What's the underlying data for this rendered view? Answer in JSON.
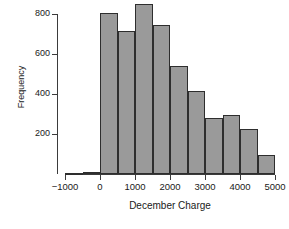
{
  "chart_data": {
    "type": "bar",
    "title": "",
    "xlabel": "December Charge",
    "ylabel": "Frequency",
    "xlim": [
      -1000,
      5000
    ],
    "ylim": [
      0,
      870
    ],
    "grid": false,
    "legend": null,
    "xticks": [
      -1000,
      0,
      1000,
      2000,
      3000,
      4000,
      5000
    ],
    "xtick_labels": [
      "−1000",
      "0",
      "1000",
      "2000",
      "3000",
      "4000",
      "5000"
    ],
    "yticks": [
      200,
      400,
      600,
      800
    ],
    "ytick_labels": [
      "200",
      "400",
      "600",
      "800"
    ],
    "bin_width": 500,
    "bins": [
      {
        "left": -1000,
        "right": -500,
        "value": 4
      },
      {
        "left": -500,
        "right": 0,
        "value": 8
      },
      {
        "left": 0,
        "right": 500,
        "value": 805
      },
      {
        "left": 500,
        "right": 1000,
        "value": 715
      },
      {
        "left": 1000,
        "right": 1500,
        "value": 850
      },
      {
        "left": 1500,
        "right": 2000,
        "value": 745
      },
      {
        "left": 2000,
        "right": 2500,
        "value": 540
      },
      {
        "left": 2500,
        "right": 3000,
        "value": 415
      },
      {
        "left": 3000,
        "right": 3500,
        "value": 280
      },
      {
        "left": 3500,
        "right": 4000,
        "value": 295
      },
      {
        "left": 4000,
        "right": 4500,
        "value": 225
      },
      {
        "left": 4500,
        "right": 5000,
        "value": 95
      }
    ],
    "categories": [
      "-1000 to -500",
      "-500 to 0",
      "0 to 500",
      "500 to 1000",
      "1000 to 1500",
      "1500 to 2000",
      "2000 to 2500",
      "2500 to 3000",
      "3000 to 3500",
      "3500 to 4000",
      "4000 to 4500",
      "4500 to 5000"
    ],
    "values": [
      4,
      8,
      805,
      715,
      850,
      745,
      540,
      415,
      280,
      295,
      225,
      95
    ],
    "colors": {
      "bar_fill": "#9a9a9a",
      "bar_edge": "#2e2e2e",
      "axis": "#3b3b3b",
      "text": "#1a1a1a",
      "background": "#ffffff"
    }
  }
}
